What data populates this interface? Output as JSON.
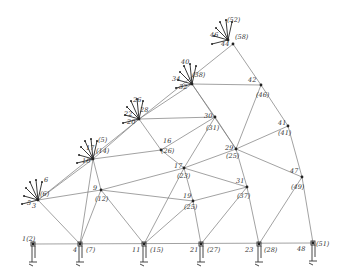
{
  "diagram": {
    "type": "truss-mesh",
    "nodes": [
      {
        "id": "n1",
        "x": 33,
        "y": 244,
        "label": "1(2)",
        "lx": 22,
        "ly": 241
      },
      {
        "id": "n4",
        "x": 80,
        "y": 244,
        "label": "4",
        "lx": 73,
        "ly": 252
      },
      {
        "id": "n4e",
        "x": 80,
        "y": 244,
        "label": "(7)",
        "lx": 86,
        "ly": 252
      },
      {
        "id": "n11",
        "x": 144,
        "y": 244,
        "label": "11",
        "lx": 132,
        "ly": 252
      },
      {
        "id": "n11e",
        "x": 144,
        "y": 244,
        "label": "(15)",
        "lx": 150,
        "ly": 252
      },
      {
        "id": "n21",
        "x": 201,
        "y": 244,
        "label": "21",
        "lx": 190,
        "ly": 252
      },
      {
        "id": "n21e",
        "x": 201,
        "y": 244,
        "label": "(27)",
        "lx": 207,
        "ly": 252
      },
      {
        "id": "n23",
        "x": 259,
        "y": 244,
        "label": "23",
        "lx": 245,
        "ly": 252
      },
      {
        "id": "n23e",
        "x": 259,
        "y": 244,
        "label": "(28)",
        "lx": 264,
        "ly": 252
      },
      {
        "id": "n48",
        "x": 313,
        "y": 243,
        "label": "48",
        "lx": 297,
        "ly": 251
      },
      {
        "id": "n48e",
        "x": 313,
        "y": 243,
        "label": "(51)",
        "lx": 316,
        "ly": 246
      },
      {
        "id": "n3",
        "x": 38,
        "y": 200,
        "label": "3",
        "lx": 32,
        "ly": 208
      },
      {
        "id": "n3e",
        "x": 38,
        "y": 200,
        "label": "(6)",
        "lx": 40,
        "ly": 196
      },
      {
        "id": "n9",
        "x": 101,
        "y": 190,
        "label": "9",
        "lx": 93,
        "ly": 190
      },
      {
        "id": "n9e",
        "x": 101,
        "y": 190,
        "label": "(12)",
        "lx": 95,
        "ly": 201
      },
      {
        "id": "n10",
        "x": 93,
        "y": 159,
        "label": "10",
        "lx": 82,
        "ly": 163
      },
      {
        "id": "n10e",
        "x": 93,
        "y": 159,
        "label": "(14)",
        "lx": 96,
        "ly": 153
      },
      {
        "id": "n17",
        "x": 184,
        "y": 168,
        "label": "17",
        "lx": 174,
        "ly": 168
      },
      {
        "id": "n17e",
        "x": 184,
        "y": 168,
        "label": "(23)",
        "lx": 177,
        "ly": 178
      },
      {
        "id": "n19",
        "x": 193,
        "y": 201,
        "label": "19",
        "lx": 183,
        "ly": 198
      },
      {
        "id": "n19e",
        "x": 193,
        "y": 201,
        "label": "(25)",
        "lx": 184,
        "ly": 209
      },
      {
        "id": "n16e",
        "x": 161,
        "y": 150,
        "label": "(26)",
        "lx": 161,
        "ly": 153
      },
      {
        "id": "n16",
        "x": 161,
        "y": 150,
        "label": "16",
        "lx": 163,
        "ly": 143
      },
      {
        "id": "n20",
        "x": 139,
        "y": 119,
        "label": "20",
        "lx": 127,
        "ly": 124
      },
      {
        "id": "n20e",
        "x": 139,
        "y": 119,
        "label": "28",
        "lx": 140,
        "ly": 112
      },
      {
        "id": "n30",
        "x": 215,
        "y": 117,
        "label": "30",
        "lx": 204,
        "ly": 118
      },
      {
        "id": "n30e",
        "x": 215,
        "y": 117,
        "label": "(31)",
        "lx": 206,
        "ly": 130
      },
      {
        "id": "n29",
        "x": 236,
        "y": 149,
        "label": "29",
        "lx": 225,
        "ly": 150
      },
      {
        "id": "n29e",
        "x": 236,
        "y": 149,
        "label": "(25)",
        "lx": 226,
        "ly": 158
      },
      {
        "id": "n31",
        "x": 247,
        "y": 187,
        "label": "31",
        "lx": 236,
        "ly": 183
      },
      {
        "id": "n31e",
        "x": 247,
        "y": 187,
        "label": "(37)",
        "lx": 237,
        "ly": 198
      },
      {
        "id": "n32",
        "x": 192,
        "y": 84,
        "label": "32",
        "lx": 179,
        "ly": 89
      },
      {
        "id": "n32e",
        "x": 192,
        "y": 84,
        "label": "(38)",
        "lx": 192,
        "ly": 77
      },
      {
        "id": "n42",
        "x": 261,
        "y": 85,
        "label": "42",
        "lx": 248,
        "ly": 82
      },
      {
        "id": "n42e",
        "x": 261,
        "y": 85,
        "label": "(46)",
        "lx": 256,
        "ly": 97
      },
      {
        "id": "n41",
        "x": 288,
        "y": 126,
        "label": "41",
        "lx": 278,
        "ly": 125
      },
      {
        "id": "n41e",
        "x": 288,
        "y": 126,
        "label": "(41)",
        "lx": 278,
        "ly": 135
      },
      {
        "id": "n47",
        "x": 302,
        "y": 177,
        "label": "47",
        "lx": 290,
        "ly": 173
      },
      {
        "id": "n47e",
        "x": 302,
        "y": 177,
        "label": "(49)",
        "lx": 291,
        "ly": 189
      },
      {
        "id": "n44",
        "x": 233,
        "y": 44,
        "label": "44",
        "lx": 221,
        "ly": 46
      },
      {
        "id": "n44e",
        "x": 233,
        "y": 44,
        "label": "(58)",
        "lx": 235,
        "ly": 39
      },
      {
        "id": "n46",
        "x": 228,
        "y": 40,
        "label": "46",
        "lx": 210,
        "ly": 37
      }
    ],
    "extra_labels": [
      {
        "text": "(52)",
        "x": 227,
        "y": 22
      },
      {
        "text": "22",
        "x": 124,
        "y": 116
      },
      {
        "text": "26",
        "x": 133,
        "y": 102
      },
      {
        "text": "34",
        "x": 172,
        "y": 81
      },
      {
        "text": "40",
        "x": 181,
        "y": 64
      },
      {
        "text": "17",
        "x": 86,
        "y": 150
      },
      {
        "text": "(5)",
        "x": 98,
        "y": 142
      },
      {
        "text": "5",
        "x": 27,
        "y": 205
      },
      {
        "text": "6",
        "x": 44,
        "y": 182
      }
    ],
    "members": [
      [
        33,
        244,
        313,
        243
      ],
      [
        80,
        244,
        38,
        200
      ],
      [
        80,
        244,
        101,
        190
      ],
      [
        80,
        244,
        93,
        159
      ],
      [
        38,
        200,
        101,
        190
      ],
      [
        38,
        200,
        93,
        159
      ],
      [
        38,
        200,
        233,
        44
      ],
      [
        101,
        190,
        144,
        244
      ],
      [
        101,
        190,
        184,
        168
      ],
      [
        101,
        190,
        93,
        159
      ],
      [
        101,
        190,
        193,
        201
      ],
      [
        93,
        159,
        161,
        150
      ],
      [
        93,
        159,
        139,
        119
      ],
      [
        144,
        244,
        193,
        201
      ],
      [
        144,
        244,
        184,
        168
      ],
      [
        161,
        150,
        184,
        168
      ],
      [
        161,
        150,
        139,
        119
      ],
      [
        161,
        150,
        215,
        117
      ],
      [
        139,
        119,
        215,
        117
      ],
      [
        139,
        119,
        192,
        84
      ],
      [
        184,
        168,
        193,
        201
      ],
      [
        184,
        168,
        236,
        149
      ],
      [
        184,
        168,
        247,
        187
      ],
      [
        184,
        168,
        215,
        117
      ],
      [
        193,
        201,
        201,
        244
      ],
      [
        193,
        201,
        247,
        187
      ],
      [
        201,
        244,
        247,
        187
      ],
      [
        215,
        117,
        236,
        149
      ],
      [
        215,
        117,
        192,
        84
      ],
      [
        192,
        84,
        261,
        85
      ],
      [
        192,
        84,
        236,
        149
      ],
      [
        236,
        149,
        247,
        187
      ],
      [
        236,
        149,
        261,
        85
      ],
      [
        236,
        149,
        288,
        126
      ],
      [
        236,
        149,
        302,
        177
      ],
      [
        247,
        187,
        259,
        244
      ],
      [
        259,
        244,
        302,
        177
      ],
      [
        261,
        85,
        288,
        126
      ],
      [
        261,
        85,
        233,
        44
      ],
      [
        288,
        126,
        302,
        177
      ],
      [
        302,
        177,
        313,
        243
      ]
    ],
    "supports": [
      {
        "x": 33,
        "y": 244
      },
      {
        "x": 80,
        "y": 244
      },
      {
        "x": 144,
        "y": 244
      },
      {
        "x": 201,
        "y": 244
      },
      {
        "x": 259,
        "y": 244
      },
      {
        "x": 313,
        "y": 243
      }
    ],
    "load_clusters": [
      {
        "x": 38,
        "y": 200
      },
      {
        "x": 93,
        "y": 159
      },
      {
        "x": 139,
        "y": 119
      },
      {
        "x": 192,
        "y": 84
      },
      {
        "x": 228,
        "y": 40
      }
    ]
  }
}
